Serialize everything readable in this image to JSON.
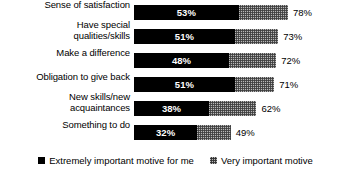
{
  "chart_data": {
    "type": "bar",
    "orientation": "horizontal",
    "stacked": true,
    "title": "",
    "xlabel": "",
    "ylabel": "",
    "xlim": [
      0,
      78
    ],
    "grid": false,
    "legend_position": "bottom-center",
    "categories": [
      "Sense of satisfaction",
      "Have special\nqualities/skills",
      "Make a difference",
      "Obligation to give back",
      "New skills/new\nacquaintances",
      "Something to do"
    ],
    "series": [
      {
        "name": "Extremely important motive for me",
        "color": "#000000",
        "values": [
          53,
          51,
          48,
          51,
          38,
          32
        ]
      },
      {
        "name": "Very important motive",
        "color": "#9a9a9a",
        "values": [
          25,
          22,
          24,
          20,
          24,
          17
        ]
      }
    ],
    "totals": [
      78,
      73,
      72,
      71,
      62,
      49
    ],
    "value_labels": [
      "53%",
      "51%",
      "48%",
      "51%",
      "38%",
      "32%"
    ],
    "total_labels": [
      "78%",
      "73%",
      "72%",
      "71%",
      "62%",
      "49%"
    ]
  },
  "rows": [
    {
      "label": "Sense of satisfaction",
      "label_lines": [
        "Sense of satisfaction"
      ],
      "primary_value": 53,
      "primary_label": "53%",
      "total_value": 78,
      "total_label": "78%"
    },
    {
      "label": "Have special qualities/skills",
      "label_lines": [
        "Have special",
        "qualities/skills"
      ],
      "primary_value": 51,
      "primary_label": "51%",
      "total_value": 73,
      "total_label": "73%"
    },
    {
      "label": "Make a difference",
      "label_lines": [
        "Make a difference"
      ],
      "primary_value": 48,
      "primary_label": "48%",
      "total_value": 72,
      "total_label": "72%"
    },
    {
      "label": "Obligation to give back",
      "label_lines": [
        "Obligation to give back"
      ],
      "primary_value": 51,
      "primary_label": "51%",
      "total_value": 71,
      "total_label": "71%"
    },
    {
      "label": "New skills/new acquaintances",
      "label_lines": [
        "New skills/new",
        "acquaintances"
      ],
      "primary_value": 38,
      "primary_label": "38%",
      "total_value": 62,
      "total_label": "62%"
    },
    {
      "label": "Something to do",
      "label_lines": [
        "Something to do"
      ],
      "primary_value": 32,
      "primary_label": "32%",
      "total_value": 49,
      "total_label": "49%"
    }
  ],
  "legend": {
    "items": [
      {
        "label": "Extremely important motive for me",
        "swatch": "primary"
      },
      {
        "label": "Very important motive",
        "swatch": "secondary"
      }
    ]
  },
  "layout": {
    "bar_origin_x": 134,
    "px_per_percent": 1.975,
    "row_pitch": 24,
    "bar_height": 15
  }
}
